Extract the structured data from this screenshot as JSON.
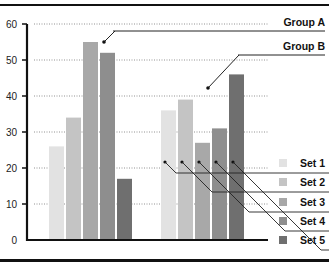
{
  "chart_data": {
    "type": "bar",
    "title": "",
    "xlabel": "",
    "ylabel": "",
    "ylim": [
      0,
      60
    ],
    "yticks": [
      0,
      10,
      20,
      30,
      40,
      50,
      60
    ],
    "grid": "dotted horizontal",
    "categories": [
      "Group A",
      "Group B"
    ],
    "series": [
      {
        "name": "Set 1",
        "color": "#e2e2e2",
        "values": [
          26,
          36
        ]
      },
      {
        "name": "Set 2",
        "color": "#c4c4c4",
        "values": [
          34,
          39
        ]
      },
      {
        "name": "Set 3",
        "color": "#a8a8a8",
        "values": [
          55,
          27
        ]
      },
      {
        "name": "Set 4",
        "color": "#8e8e8e",
        "values": [
          52,
          31
        ]
      },
      {
        "name": "Set 5",
        "color": "#6f6f6f",
        "values": [
          17,
          46
        ]
      }
    ],
    "legend_position": "right, callout lines",
    "annotations": [
      "Group A",
      "Group B"
    ]
  }
}
